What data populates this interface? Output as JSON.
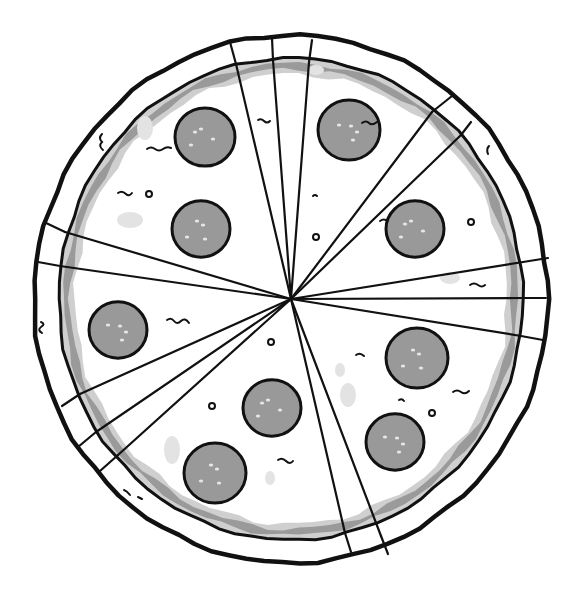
{
  "image": {
    "subject": "Sliced pepperoni pizza, top view, line-art illustration",
    "width": 578,
    "height": 589,
    "background": "#ffffff"
  },
  "colors": {
    "outline": "#111111",
    "crust": "#ffffff",
    "sauce_shadow": "#9a9a9a",
    "sauce_light": "#cfcfcf",
    "cheese": "#ffffff",
    "cheese_blob": "#e3e3e3",
    "pepperoni": "#999999",
    "pepperoni_highlight": "#e6e6e6"
  },
  "pizza": {
    "center": [
      291,
      299
    ],
    "outer_radius": [
      257,
      264
    ],
    "inner_radius": [
      232,
      241
    ],
    "slice_count": 13,
    "cut_lines": [
      {
        "outer": [
          230,
          42
        ],
        "inner": [
          236,
          64
        ]
      },
      {
        "outer": [
          272,
          38
        ],
        "inner": [
          273,
          60
        ]
      },
      {
        "outer": [
          312,
          40
        ],
        "inner": [
          309,
          62
        ]
      },
      {
        "outer": [
          452,
          96
        ],
        "inner": [
          432,
          112
        ]
      },
      {
        "outer": [
          471,
          122
        ],
        "inner": [
          461,
          135
        ]
      },
      {
        "outer": [
          548,
          258
        ],
        "inner": [
          523,
          262
        ]
      },
      {
        "outer": [
          546,
          298
        ],
        "inner": [
          523,
          298
        ]
      },
      {
        "outer": [
          543,
          340
        ],
        "inner": [
          521,
          336
        ]
      },
      {
        "outer": [
          388,
          554
        ],
        "inner": [
          381,
          536
        ]
      },
      {
        "outer": [
          351,
          552
        ],
        "inner": [
          345,
          533
        ]
      },
      {
        "outer": [
          100,
          471
        ],
        "inner": [
          118,
          455
        ]
      },
      {
        "outer": [
          78,
          447
        ],
        "inner": [
          96,
          432
        ]
      },
      {
        "outer": [
          62,
          406
        ],
        "inner": [
          80,
          394
        ]
      },
      {
        "outer": [
          38,
          262
        ],
        "inner": [
          60,
          266
        ]
      },
      {
        "outer": [
          44,
          222
        ],
        "inner": [
          65,
          232
        ]
      }
    ]
  },
  "pepperoni": [
    {
      "cx": 205,
      "cy": 137,
      "r": 30
    },
    {
      "cx": 349,
      "cy": 130,
      "r": 31
    },
    {
      "cx": 201,
      "cy": 229,
      "r": 29
    },
    {
      "cx": 415,
      "cy": 229,
      "r": 29
    },
    {
      "cx": 118,
      "cy": 330,
      "r": 29
    },
    {
      "cx": 417,
      "cy": 358,
      "r": 31
    },
    {
      "cx": 272,
      "cy": 408,
      "r": 29
    },
    {
      "cx": 395,
      "cy": 442,
      "r": 29
    },
    {
      "cx": 215,
      "cy": 473,
      "r": 31
    }
  ],
  "small_circles": [
    {
      "cx": 149,
      "cy": 194,
      "r": 3
    },
    {
      "cx": 316,
      "cy": 237,
      "r": 3
    },
    {
      "cx": 271,
      "cy": 342,
      "r": 3
    },
    {
      "cx": 212,
      "cy": 406,
      "r": 3
    },
    {
      "cx": 432,
      "cy": 413,
      "r": 3
    },
    {
      "cx": 471,
      "cy": 222,
      "r": 3
    }
  ],
  "cheese_blobs": [
    {
      "cx": 145,
      "cy": 128,
      "rx": 8,
      "ry": 12
    },
    {
      "cx": 130,
      "cy": 220,
      "rx": 13,
      "ry": 8
    },
    {
      "cx": 172,
      "cy": 450,
      "rx": 8,
      "ry": 14
    },
    {
      "cx": 348,
      "cy": 395,
      "rx": 8,
      "ry": 12
    },
    {
      "cx": 340,
      "cy": 370,
      "rx": 5,
      "ry": 7
    },
    {
      "cx": 270,
      "cy": 478,
      "rx": 5,
      "ry": 7
    },
    {
      "cx": 450,
      "cy": 278,
      "rx": 10,
      "ry": 6
    },
    {
      "cx": 316,
      "cy": 70,
      "rx": 8,
      "ry": 5
    }
  ],
  "squiggles": [
    {
      "d": "M147,149 q4,-3 8,0 t8,0 t8,-1"
    },
    {
      "d": "M118,193 q4,-3 8,1 q3,3 6,-1"
    },
    {
      "d": "M167,320 q4,-3 7,1 t7,0 t8,2"
    },
    {
      "d": "M362,123 q4,-3 7,0 t8,-1"
    },
    {
      "d": "M258,120 q3,-2 6,1 t6,0"
    },
    {
      "d": "M380,221 q4,-3 7,0"
    },
    {
      "d": "M356,355 q4,-3 8,1"
    },
    {
      "d": "M453,392 q4,-3 8,0 t8,-1"
    },
    {
      "d": "M278,460 q4,-3 8,1 t7,0"
    },
    {
      "d": "M470,285 q4,-3 8,0 t7,0"
    },
    {
      "d": "M399,400 q3,-2 5,1"
    },
    {
      "d": "M313,196 q2,-2 4,0"
    },
    {
      "d": "M41,322 q5,2 0,5 q-4,3 1,6"
    },
    {
      "d": "M102,134 q-4,4 0,8 q-4,4 1,8"
    },
    {
      "d": "M489,146 q-3,3 -1,8"
    },
    {
      "d": "M124,490 q3,1 6,5"
    },
    {
      "d": "M138,497 q2,1 4,2"
    }
  ]
}
